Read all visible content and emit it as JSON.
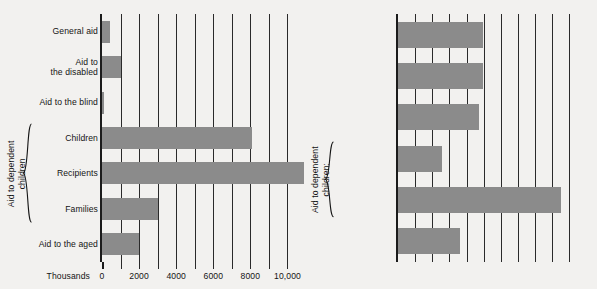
{
  "chart_data": [
    {
      "id": "welfare-recipients",
      "type": "bar",
      "orientation": "horizontal",
      "title": "",
      "xlabel": "Thousands",
      "ylabel": "",
      "xlim": [
        0,
        11000
      ],
      "xticks": [
        0,
        1000,
        2000,
        3000,
        4000,
        5000,
        6000,
        7000,
        8000,
        9000,
        10000
      ],
      "xtick_labels": [
        "0",
        "",
        "2000",
        "",
        "4000",
        "",
        "6000",
        "",
        "8000",
        "",
        "10,000"
      ],
      "grid": true,
      "legend": "none",
      "categories": [
        "General aid",
        "Aid to\nthe disabled",
        "Aid to the blind",
        "Children",
        "Recipients",
        "Families",
        "Aid to the aged"
      ],
      "category_lines": [
        [
          "General aid"
        ],
        [
          "Aid to",
          "the disabled"
        ],
        [
          "Aid to the blind"
        ],
        [
          "Children"
        ],
        [
          "Recipients"
        ],
        [
          "Families"
        ],
        [
          "Aid to the aged"
        ]
      ],
      "values": [
        420,
        1000,
        80,
        8100,
        10900,
        3000,
        2000
      ],
      "group_bracket": {
        "label_lines": [
          "Aid to dependent",
          "children"
        ],
        "covers": [
          "Children",
          "Recipients",
          "Families"
        ]
      }
    },
    {
      "id": "welfare-payments",
      "type": "bar",
      "orientation": "horizontal",
      "title": "",
      "xlabel": "1972\nDollars",
      "ylabel": "",
      "xlim": [
        0,
        210
      ],
      "xticks": [
        0,
        20,
        40,
        60,
        80,
        100,
        120,
        140,
        160,
        180,
        200
      ],
      "xtick_labels": [
        "0",
        "",
        "40",
        "",
        "80",
        "",
        "120",
        "",
        "160",
        "",
        "200"
      ],
      "grid": true,
      "legend": "none",
      "categories": [
        "General\nassistance",
        "Aid to\nthe disabled",
        "Aid to the blind",
        "Per\nrecipient",
        "Per family",
        "Old age\nassistance"
      ],
      "category_lines": [
        [
          "General",
          "assistance"
        ],
        [
          "Aid to",
          "the disabled"
        ],
        [
          "Aid to the blind"
        ],
        [
          "Per",
          "recipient"
        ],
        [
          "Per family"
        ],
        [
          "Old age",
          "assistance"
        ]
      ],
      "values": [
        99,
        99,
        95,
        51,
        190,
        72
      ],
      "group_bracket": {
        "label_lines": [
          "Aid to dependent",
          "children:"
        ],
        "covers": [
          "Per recipient",
          "Per family"
        ]
      }
    }
  ],
  "style": {
    "background_color": "#f2f1ef",
    "bar_color": "#8b8b8b",
    "axis_color": "#1b1b1b",
    "grid_color": "#2a2a2a",
    "text_color": "#141414"
  }
}
